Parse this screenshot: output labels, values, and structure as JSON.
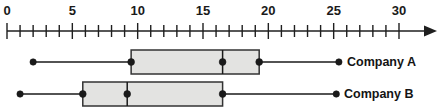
{
  "chart_data": {
    "type": "box",
    "title": "",
    "xlabel": "",
    "ylabel": "",
    "orientation": "horizontal",
    "grid": false,
    "legend_position": "right-labels",
    "axis": {
      "min": 0,
      "max": 30,
      "tick_interval": 1,
      "label_interval": 5,
      "tick_labels": [
        "0",
        "5",
        "10",
        "15",
        "20",
        "25",
        "30"
      ],
      "tick_label_values": [
        0,
        5,
        10,
        15,
        20,
        25,
        30
      ],
      "arrow_end": true
    },
    "categories": [
      "Company A",
      "Company B"
    ],
    "series": [
      {
        "name": "Company A",
        "min": 2,
        "q1": 9.5,
        "median": 16.5,
        "q3": 19.3,
        "max": 25.4
      },
      {
        "name": "Company B",
        "min": 1,
        "q1": 5.8,
        "median": 9.2,
        "q3": 16.5,
        "max": 25.2
      }
    ]
  },
  "labels": {
    "company_a": "Company A",
    "company_b": "Company B"
  },
  "colors": {
    "box_fill": "#e3e3e1",
    "box_stroke": "#333333",
    "line": "#1a1a1a",
    "axis": "#1f1f1f",
    "text": "#141414"
  }
}
